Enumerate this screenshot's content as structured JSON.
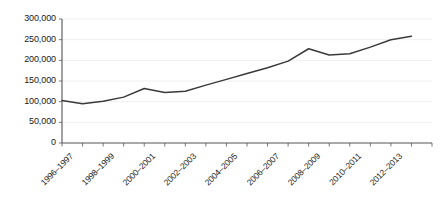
{
  "chart_data": {
    "type": "line",
    "title": "",
    "subtitle": "",
    "xlabel": "",
    "ylabel": "",
    "grid": "horizontal",
    "legend": "none",
    "ylim": [
      0,
      300000
    ],
    "yticks": [
      0,
      50000,
      100000,
      150000,
      200000,
      250000,
      300000
    ],
    "ytick_labels": [
      "0",
      "50,000",
      "100,000",
      "150,000",
      "200,000",
      "250,000",
      "300,000"
    ],
    "categories": [
      "1996–1997",
      "1997–1998",
      "1998–1999",
      "1999–2000",
      "2000–2001",
      "2001–2002",
      "2002–2003",
      "2003–2004",
      "2004–2005",
      "2005–2006",
      "2006–2007",
      "2007–2008",
      "2008–2009",
      "2009–2010",
      "2010–2011",
      "2011–2012",
      "2012–2013",
      "2013–2014"
    ],
    "xtick_labels_shown": [
      "1996–1997",
      "1998–1999",
      "2000–2001",
      "2002–2003",
      "2004–2005",
      "2006–2007",
      "2008–2009",
      "2010–2011",
      "2012–2013"
    ],
    "xtick_label_rotation": -45,
    "values": [
      103000,
      95000,
      101000,
      111000,
      132000,
      122000,
      125000,
      140000,
      154000,
      168000,
      182000,
      198000,
      228000,
      213000,
      216000,
      232000,
      250000,
      258000
    ],
    "series": [
      {
        "name": "series-1",
        "color": "#3a3a3a",
        "line_width": 1.5,
        "markers": false,
        "values": [
          103000,
          95000,
          101000,
          111000,
          132000,
          122000,
          125000,
          140000,
          154000,
          168000,
          182000,
          198000,
          228000,
          213000,
          216000,
          232000,
          250000,
          258000
        ]
      }
    ]
  },
  "style": {
    "background": "#ffffff",
    "axis_color": "#555555",
    "grid_color": "#f0f0f0",
    "tick_color": "#777777",
    "text_color": "#1a1a1a",
    "line_color": "#3a3a3a"
  },
  "geometry": {
    "plot_left": 62,
    "plot_right": 432,
    "plot_top": 19,
    "plot_bottom": 143
  }
}
